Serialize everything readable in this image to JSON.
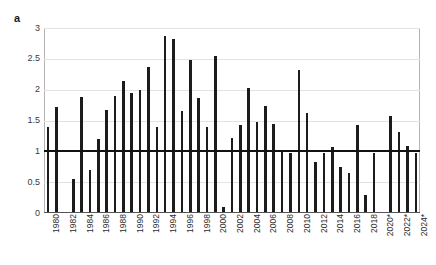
{
  "panel": {
    "label": "a"
  },
  "chart_data": {
    "type": "bar",
    "title": "",
    "subtitle": "",
    "xlabel": "",
    "ylabel": "",
    "ylim": [
      0,
      3
    ],
    "y_ticks": [
      "0",
      "0.5",
      "1",
      "1.5",
      "2",
      "2.5",
      "3"
    ],
    "y_tick_values": [
      0,
      0.5,
      1,
      1.5,
      2,
      2.5,
      3
    ],
    "grid": true,
    "legend": "none",
    "reference_line": {
      "value": 1,
      "color": "#111111",
      "label": ""
    },
    "bar_color": "#1c1c1c",
    "x_tick_labels": [
      "1980",
      "1982",
      "1984",
      "1986",
      "1988",
      "1990",
      "1992",
      "1994",
      "1996",
      "1998",
      "2000",
      "2002",
      "2004",
      "2006",
      "2008",
      "2010",
      "2012",
      "2014",
      "2016",
      "2018",
      "2020*",
      "2022*",
      "2024*"
    ],
    "x_tick_years": [
      1980,
      1982,
      1984,
      1986,
      1988,
      1990,
      1992,
      1994,
      1996,
      1998,
      2000,
      2002,
      2004,
      2006,
      2008,
      2010,
      2012,
      2014,
      2016,
      2018,
      2020,
      2022,
      2024
    ],
    "categories": [
      1980,
      1981,
      1982,
      1983,
      1984,
      1985,
      1986,
      1987,
      1988,
      1989,
      1990,
      1991,
      1992,
      1993,
      1994,
      1995,
      1996,
      1997,
      1998,
      1999,
      2000,
      2001,
      2002,
      2003,
      2004,
      2005,
      2006,
      2007,
      2008,
      2009,
      2010,
      2011,
      2012,
      2013,
      2014,
      2015,
      2016,
      2017,
      2018,
      2019,
      2020,
      2021,
      2022,
      2023,
      2024
    ],
    "values": [
      1.4,
      1.72,
      0.0,
      0.55,
      1.88,
      0.7,
      1.2,
      1.67,
      1.9,
      2.14,
      1.94,
      1.99,
      2.37,
      1.4,
      2.87,
      2.83,
      1.66,
      2.48,
      1.86,
      1.4,
      2.55,
      0.1,
      1.22,
      1.43,
      2.02,
      1.48,
      1.73,
      1.44,
      1.01,
      0.98,
      2.32,
      1.63,
      0.83,
      0.97,
      1.07,
      0.75,
      0.65,
      1.43,
      0.3,
      0.98,
      0.0,
      1.57,
      1.32,
      1.09,
      0.98
    ]
  }
}
